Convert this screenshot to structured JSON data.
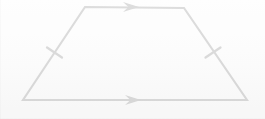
{
  "figure": {
    "kind": "geometry-diagram",
    "shape_name": "isosceles trapezoid",
    "background_color": "#fdfdfd",
    "stroke_color": "#1a1a1a",
    "stroke_width": 2.1,
    "canvas": {
      "width": 265,
      "height": 119
    },
    "vertices": [
      {
        "id": "top-left",
        "x": 85,
        "y": 7
      },
      {
        "id": "top-right",
        "x": 184,
        "y": 8
      },
      {
        "id": "bottom-right",
        "x": 247,
        "y": 100
      },
      {
        "id": "bottom-left",
        "x": 23,
        "y": 100
      }
    ],
    "sides": [
      {
        "id": "top-side",
        "from": "top-left",
        "to": "top-right",
        "marking": "single-arrow",
        "label": ""
      },
      {
        "id": "right-leg",
        "from": "top-right",
        "to": "bottom-right",
        "marking": "single-tick",
        "label": ""
      },
      {
        "id": "bottom-side",
        "from": "bottom-right",
        "to": "bottom-left",
        "marking": "single-arrow",
        "label": ""
      },
      {
        "id": "left-leg",
        "from": "bottom-left",
        "to": "top-left",
        "marking": "single-tick",
        "label": ""
      }
    ],
    "arrow_markers": [
      {
        "id": "top-parallel-arrow",
        "tip_x": 139,
        "tip_y": 7,
        "length": 16,
        "half_height": 5,
        "direction": "right"
      },
      {
        "id": "bottom-parallel-arrow",
        "tip_x": 141,
        "tip_y": 100,
        "length": 16,
        "half_height": 5,
        "direction": "right"
      }
    ],
    "tick_marks": [
      {
        "id": "left-leg-tick",
        "cx": 54.5,
        "cy": 52.5,
        "length": 18,
        "angle_deg": 34
      },
      {
        "id": "right-leg-tick",
        "cx": 213,
        "cy": 52.5,
        "length": 18,
        "angle_deg": -34
      }
    ],
    "annotations": []
  }
}
